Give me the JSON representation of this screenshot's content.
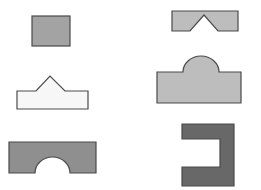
{
  "diagram": {
    "width": 261,
    "height": 190,
    "background": "#ffffff",
    "stroke": "#4a4a4a",
    "shapes": [
      {
        "id": "square",
        "fill": "#a3a3a3"
      },
      {
        "id": "notched-bar",
        "fill": "#bdbdbd"
      },
      {
        "id": "house-pentagon",
        "fill": "#f7f7f7"
      },
      {
        "id": "dome-block",
        "fill": "#bdbdbd"
      },
      {
        "id": "arch-block",
        "fill": "#8f8f8f"
      },
      {
        "id": "c-bracket",
        "fill": "#686868"
      }
    ]
  }
}
